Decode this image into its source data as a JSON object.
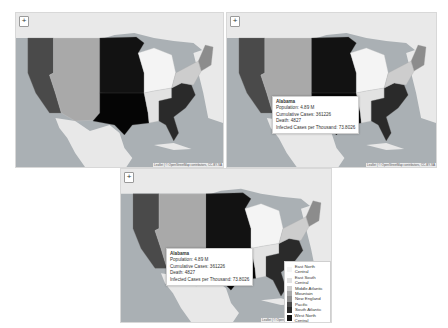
{
  "panels": [
    {
      "id": "panel-1",
      "x": 15,
      "y": 12,
      "w": 207,
      "h": 154,
      "popup": false,
      "legend": false
    },
    {
      "id": "panel-2",
      "x": 226,
      "y": 12,
      "w": 209,
      "h": 154,
      "popup": true,
      "legend": false
    },
    {
      "id": "panel-3",
      "x": 120,
      "y": 168,
      "w": 210,
      "h": 153,
      "popup": true,
      "legend": true
    }
  ],
  "map": {
    "zoom_in_label": "+",
    "attribution": "Leaflet | © OpenStreetMap contributors, CC-BY-SA",
    "labels": {
      "mexico": "México",
      "cuba": "La Habana",
      "city": "Ciudad de México",
      "ottawa": "Ottawa"
    }
  },
  "popup": {
    "title": "Alabama",
    "population": "Population: 4.89 M",
    "cumulative_cases": "Cumulative Cases: 361226",
    "death": "Death: 4827",
    "infected_per_thousand": "Infected Cases per Thousand: 73.8026"
  },
  "legend": {
    "items": [
      {
        "label": "East North Central",
        "color": "#f4f4f4"
      },
      {
        "label": "East South Central",
        "color": "#e2e2e2"
      },
      {
        "label": "Middle Atlantic",
        "color": "#cdcdcd"
      },
      {
        "label": "Mountain",
        "color": "#a9a9a9"
      },
      {
        "label": "New England",
        "color": "#8c8c8c"
      },
      {
        "label": "Pacific",
        "color": "#4a4a4a"
      },
      {
        "label": "South Atlantic",
        "color": "#2a2a2a"
      },
      {
        "label": "West North Central",
        "color": "#121212"
      },
      {
        "label": "West South Central",
        "color": "#050505"
      }
    ]
  },
  "colors": {
    "water": "#aab0b4",
    "land": "#e6e6e6",
    "pacific": "#4a4a4a",
    "mountain": "#a9a9a9",
    "west_north_central": "#121212",
    "west_south_central": "#050505",
    "east_north_central": "#f4f4f4",
    "east_south_central": "#e2e2e2",
    "south_atlantic": "#2a2a2a",
    "middle_atlantic": "#cdcdcd",
    "new_england": "#8c8c8c"
  }
}
